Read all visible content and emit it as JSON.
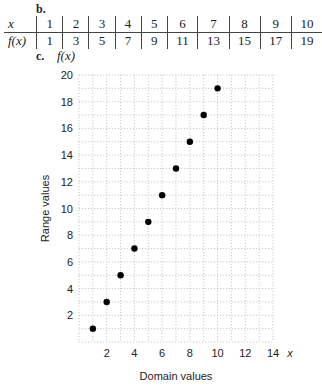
{
  "labels": {
    "part_b": "b.",
    "part_c": "c.",
    "y_var": "f(x)"
  },
  "table": {
    "row_headers": [
      "x",
      "f(x)"
    ],
    "x": [
      1,
      2,
      3,
      4,
      5,
      6,
      7,
      8,
      9,
      10
    ],
    "fx": [
      1,
      3,
      5,
      7,
      9,
      11,
      13,
      15,
      17,
      19
    ]
  },
  "chart_data": {
    "type": "scatter",
    "title": "",
    "xlabel": "Domain values",
    "ylabel": "Range values",
    "x_axis_symbol": "x",
    "y_axis_symbol": "f(x)",
    "x": [
      1,
      2,
      3,
      4,
      5,
      6,
      7,
      8,
      9,
      10
    ],
    "y": [
      1,
      3,
      5,
      7,
      9,
      11,
      13,
      15,
      17,
      19
    ],
    "xlim": [
      0,
      14
    ],
    "ylim": [
      0,
      20
    ],
    "x_ticks": [
      2,
      4,
      6,
      8,
      10,
      12,
      14
    ],
    "y_ticks": [
      2,
      4,
      6,
      8,
      10,
      12,
      14,
      16,
      18,
      20
    ],
    "grid": true,
    "grid_style": "dotted",
    "marker_color": "#000000"
  }
}
